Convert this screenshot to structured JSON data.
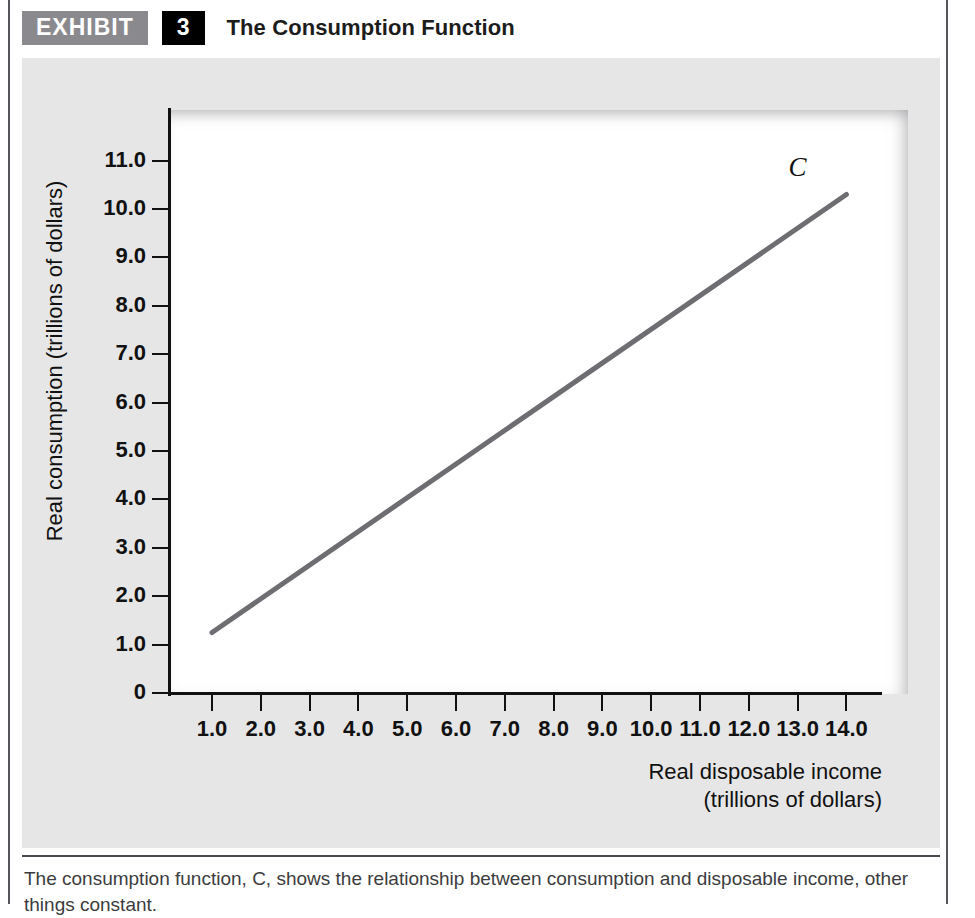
{
  "exhibit": {
    "tag": "EXHIBIT",
    "number": "3",
    "title": "The Consumption Function"
  },
  "caption": {
    "line1": "The consumption function, C, shows the relationship between consumption and disposable income, other",
    "line2": "things constant."
  },
  "chart_data": {
    "type": "line",
    "title": "The Consumption Function",
    "xlabel": "Real disposable income",
    "xlabel_units": "(trillions of dollars)",
    "ylabel": "Real consumption (trillions of dollars)",
    "xlim": [
      0,
      14.8
    ],
    "ylim": [
      0,
      11.0
    ],
    "grid": false,
    "legend": "none",
    "x_ticks": [
      "1.0",
      "2.0",
      "3.0",
      "4.0",
      "5.0",
      "6.0",
      "7.0",
      "8.0",
      "9.0",
      "10.0",
      "11.0",
      "12.0",
      "13.0",
      "14.0"
    ],
    "x_tick_values": [
      1,
      2,
      3,
      4,
      5,
      6,
      7,
      8,
      9,
      10,
      11,
      12,
      13,
      14
    ],
    "y_ticks": [
      "0",
      "1.0",
      "2.0",
      "3.0",
      "4.0",
      "5.0",
      "6.0",
      "7.0",
      "8.0",
      "9.0",
      "10.0",
      "11.0"
    ],
    "y_tick_values": [
      0,
      1,
      2,
      3,
      4,
      5,
      6,
      7,
      8,
      9,
      10,
      11
    ],
    "series": [
      {
        "name": "C",
        "annotation": "C",
        "color": "#6e6e72",
        "line_width": 5,
        "x": [
          1.0,
          14.0
        ],
        "y": [
          1.25,
          10.3
        ]
      }
    ],
    "colors": {
      "curve": "#6e6e72",
      "axis": "#111111",
      "panel": "#e6e6e6",
      "plot_bg": "#ffffff"
    }
  }
}
